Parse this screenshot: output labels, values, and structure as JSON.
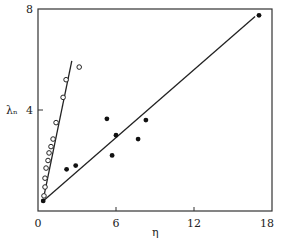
{
  "chart_data": {
    "type": "scatter",
    "title": "",
    "xlabel": "η",
    "ylabel": "λₙ",
    "xlim": [
      0,
      18
    ],
    "ylim": [
      0,
      8
    ],
    "x_ticks": [
      0,
      6,
      12,
      18
    ],
    "y_ticks": [
      4,
      8
    ],
    "x_tick_labels": [
      "0",
      "6",
      "12",
      "18"
    ],
    "y_tick_labels": [
      "4",
      "8"
    ],
    "grid": false,
    "legend": null,
    "series": [
      {
        "name": "open circles",
        "marker": "open-circle",
        "points": [
          [
            0.46,
            0.6
          ],
          [
            0.54,
            0.95
          ],
          [
            0.54,
            1.3
          ],
          [
            0.62,
            1.7
          ],
          [
            0.77,
            2.0
          ],
          [
            0.85,
            2.3
          ],
          [
            1.0,
            2.55
          ],
          [
            1.16,
            2.85
          ],
          [
            1.39,
            3.5
          ],
          [
            1.93,
            4.5
          ],
          [
            2.16,
            5.2
          ],
          [
            3.17,
            5.7
          ]
        ],
        "fit_line": [
          [
            0.5,
            0.7
          ],
          [
            2.6,
            5.95
          ]
        ]
      },
      {
        "name": "filled circles",
        "marker": "filled-circle",
        "points": [
          [
            0.4,
            0.4
          ],
          [
            2.2,
            1.65
          ],
          [
            2.9,
            1.8
          ],
          [
            5.3,
            3.65
          ],
          [
            5.7,
            2.2
          ],
          [
            6.0,
            3.0
          ],
          [
            7.7,
            2.85
          ],
          [
            8.3,
            3.6
          ],
          [
            17.0,
            7.75
          ]
        ],
        "fit_line": [
          [
            0.4,
            0.4
          ],
          [
            16.7,
            7.7
          ]
        ]
      }
    ]
  }
}
